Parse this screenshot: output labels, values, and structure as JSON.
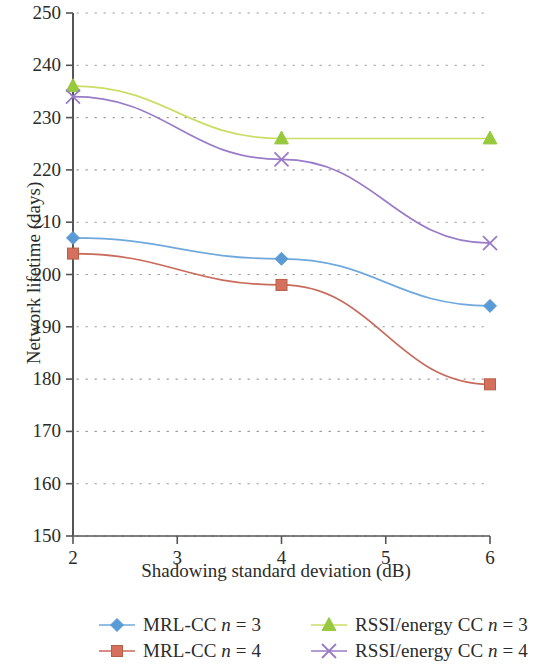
{
  "chart_data": {
    "type": "line",
    "title": "",
    "xlabel": "Shadowing standard deviation (dB)",
    "ylabel": "Network lifetime (days)",
    "x": [
      2,
      4,
      6
    ],
    "xlim": [
      2,
      6
    ],
    "ylim": [
      150,
      250
    ],
    "x_ticks": [
      "2",
      "3",
      "4",
      "5",
      "6"
    ],
    "x_tick_values": [
      2,
      3,
      4,
      5,
      6
    ],
    "y_ticks": [
      "150",
      "160",
      "170",
      "180",
      "190",
      "200",
      "210",
      "220",
      "230",
      "240",
      "250"
    ],
    "y_tick_values": [
      150,
      160,
      170,
      180,
      190,
      200,
      210,
      220,
      230,
      240,
      250
    ],
    "grid": "horizontal-dotted",
    "legend_position": "below-plot",
    "series": [
      {
        "name": "MRL-CC n = 3",
        "name_prefix": "MRL-CC ",
        "name_italic": "n",
        "name_suffix": " = 3",
        "marker": "diamond",
        "color": "#6FA8DC",
        "marker_color": "#5B9BD5",
        "values": [
          207,
          203,
          194
        ]
      },
      {
        "name": "MRL-CC n = 4",
        "name_prefix": "MRL-CC ",
        "name_italic": "n",
        "name_suffix": " = 4",
        "marker": "square",
        "color": "#C96A5B",
        "marker_color": "#D4705C",
        "values": [
          204,
          198,
          179
        ]
      },
      {
        "name": "RSSI/energy CC n = 3",
        "name_prefix": "RSSI/energy CC ",
        "name_italic": "n",
        "name_suffix": " = 3",
        "marker": "triangle",
        "color": "#CCDD66",
        "marker_color": "#96C93D",
        "values": [
          236,
          226,
          226
        ]
      },
      {
        "name": "RSSI/energy CC n = 4",
        "name_prefix": "RSSI/energy CC ",
        "name_italic": "n",
        "name_suffix": " = 4",
        "marker": "cross",
        "color": "#9A7BC8",
        "marker_color": "#9A7BC8",
        "values": [
          234,
          222,
          206
        ]
      }
    ]
  },
  "axes": {
    "y_title": "Network lifetime (days)",
    "x_title": "Shadowing standard deviation (dB)"
  },
  "legend": {
    "items": [
      {
        "label": "MRL-CC n = 3",
        "marker": "diamond",
        "color": "#6FA8DC"
      },
      {
        "label": "RSSI/energy CC n = 3",
        "marker": "triangle",
        "color": "#CCDD66"
      },
      {
        "label": "MRL-CC n = 4",
        "marker": "square",
        "color": "#C96A5B"
      },
      {
        "label": "RSSI/energy CC n = 4",
        "marker": "cross",
        "color": "#9A7BC8"
      }
    ]
  }
}
